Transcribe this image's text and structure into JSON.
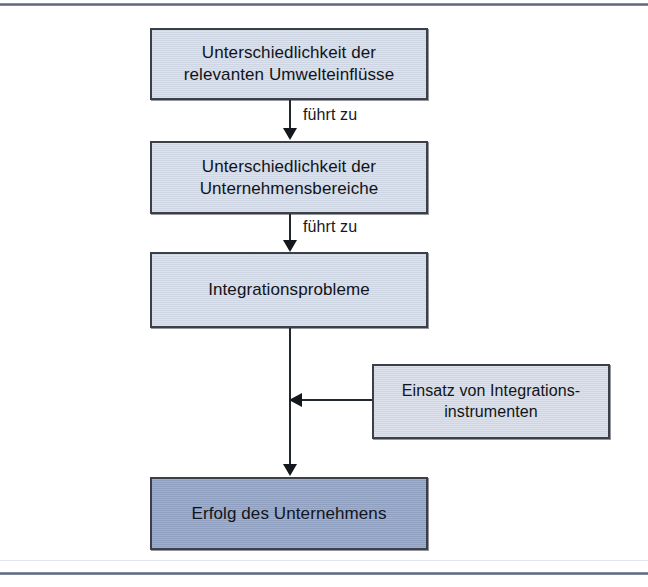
{
  "diagram": {
    "type": "flowchart",
    "language": "de",
    "colors": {
      "node_fill_light": "#ced5e3",
      "node_fill_dark": "#8f9fc0",
      "node_border": "#3a3f48",
      "connector": "#23272e",
      "text": "#111418",
      "frame_rule": "#5d6679"
    },
    "nodes": [
      {
        "id": "umwelteinfluesse",
        "line1": "Unterschiedlichkeit der",
        "line2": "relevanten Umwelteinflüsse",
        "style": "light"
      },
      {
        "id": "unternehmensbereiche",
        "line1": "Unterschiedlichkeit der",
        "line2": "Unternehmensbereiche",
        "style": "light"
      },
      {
        "id": "integrationsprobleme",
        "line1": "Integrationsprobleme",
        "line2": "",
        "style": "light"
      },
      {
        "id": "integrationsinstrumente",
        "line1": "Einsatz von Integrations-",
        "line2": "instrumenten",
        "style": "light"
      },
      {
        "id": "erfolg",
        "line1": "Erfolg des Unternehmens",
        "line2": "",
        "style": "dark"
      }
    ],
    "edges": [
      {
        "id": "e1",
        "from": "umwelteinfluesse",
        "to": "unternehmensbereiche",
        "label": "führt zu"
      },
      {
        "id": "e2",
        "from": "unternehmensbereiche",
        "to": "integrationsprobleme",
        "label": "führt zu"
      },
      {
        "id": "e3",
        "from": "integrationsprobleme",
        "to": "erfolg",
        "label": ""
      },
      {
        "id": "e4",
        "from": "integrationsinstrumente",
        "to": "e3",
        "label": ""
      }
    ]
  }
}
